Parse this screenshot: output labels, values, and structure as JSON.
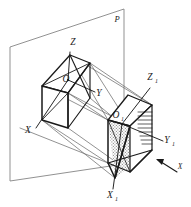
{
  "figure": {
    "background_color": "#ffffff",
    "ink_color": "#1a1a1a",
    "rail_color": "#6e6e6e",
    "plane_color": "#7a7a7a",
    "shade_color": "#a9a9a9"
  },
  "labels": {
    "plane": {
      "text": "P",
      "x": 117,
      "y": 22
    },
    "origin": {
      "text": "O",
      "x": 66,
      "y": 82
    },
    "axis_x": {
      "text": "X",
      "x": 28,
      "y": 133
    },
    "axis_y": {
      "text": "Y",
      "x": 99,
      "y": 96
    },
    "axis_z": {
      "text": "Z",
      "x": 73,
      "y": 45
    },
    "origin1": {
      "base": "O",
      "sub": "1",
      "x": 118,
      "y": 118
    },
    "axis_x1": {
      "base": "X",
      "sub": "1",
      "x": 112,
      "y": 196
    },
    "axis_y1": {
      "base": "Y",
      "sub": "1",
      "x": 168,
      "y": 143
    },
    "axis_z1": {
      "base": "Z",
      "sub": "1",
      "x": 152,
      "y": 80
    },
    "arrow_tail": {
      "base": "X",
      "sub": "",
      "x": 180,
      "y": 166
    }
  },
  "geometry": {
    "plane_polygon": "10,47 124,9 124,164 10,181",
    "left_box": {
      "top_face": "42,86 70,55 90,63 68,93",
      "front_face": "42,86 68,93 68,128 42,120",
      "side_face": "68,93 90,63 90,98 68,128"
    },
    "right_box": {
      "top_face": "108,120 128,95 152,105 130,126",
      "front_face": "108,120 130,126 130,172 108,163",
      "side_face": "130,126 152,105 152,150 130,172"
    },
    "shaded_triangle": "108,120 130,126 115,178",
    "hatch_lines": 9,
    "rail_count": 4
  },
  "annotations": {
    "arrow_label": "X",
    "arrow_direction": "up-left"
  }
}
